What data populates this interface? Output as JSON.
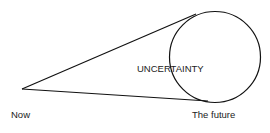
{
  "diagram": {
    "type": "cone-of-uncertainty",
    "labels": {
      "start": "Now",
      "end": "The future",
      "circle": "UNCERTAINTY"
    },
    "colors": {
      "line": "#111111",
      "text": "#222222",
      "background": "#ffffff"
    }
  }
}
